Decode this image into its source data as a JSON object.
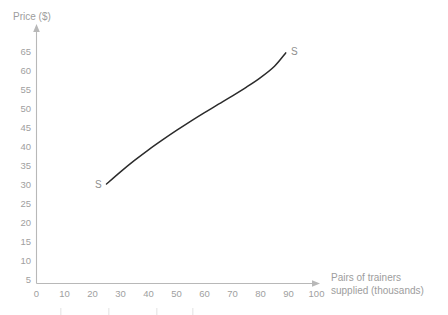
{
  "chart_data": {
    "type": "line",
    "title": "",
    "subtitle": "",
    "xlabel": "Pairs of trainers supplied (thousands)",
    "ylabel": "Price ($)",
    "xlim": [
      0,
      110
    ],
    "ylim": [
      0,
      68
    ],
    "grid": false,
    "legend": "none",
    "x_ticks": [
      0,
      10,
      20,
      30,
      40,
      50,
      60,
      70,
      80,
      90,
      100
    ],
    "y_ticks": [
      5,
      10,
      15,
      20,
      25,
      30,
      35,
      40,
      45,
      50,
      55,
      60,
      65
    ],
    "x_tick_labels": [
      "0",
      "10",
      "20",
      "30",
      "40",
      "50",
      "60",
      "70",
      "80",
      "90",
      "100"
    ],
    "y_tick_labels": [
      "5",
      "10",
      "15",
      "20",
      "25",
      "30",
      "35",
      "40",
      "45",
      "50",
      "55",
      "60",
      "65"
    ],
    "series": [
      {
        "name": "S",
        "label_start": "S",
        "label_end": "S",
        "color": "#2b2b2b",
        "x": [
          25,
          30,
          35,
          40,
          45,
          50,
          55,
          60,
          65,
          70,
          75,
          80,
          85,
          89
        ],
        "y": [
          30.0,
          33.2,
          36.2,
          39.0,
          41.6,
          44.1,
          46.5,
          48.8,
          51.0,
          53.2,
          55.5,
          58.0,
          61.0,
          64.5
        ]
      }
    ]
  },
  "axes": {
    "x_label_line1": "Pairs of trainers",
    "x_label_line2": "supplied (thousands)",
    "y_label": "Price ($)"
  },
  "annotations": {
    "supply_lower": "S",
    "supply_upper": "S"
  },
  "colors": {
    "curve": "#2b2b2b",
    "axis": "#b8b8b8",
    "text": "#9a9a9a",
    "background": "#ffffff"
  }
}
